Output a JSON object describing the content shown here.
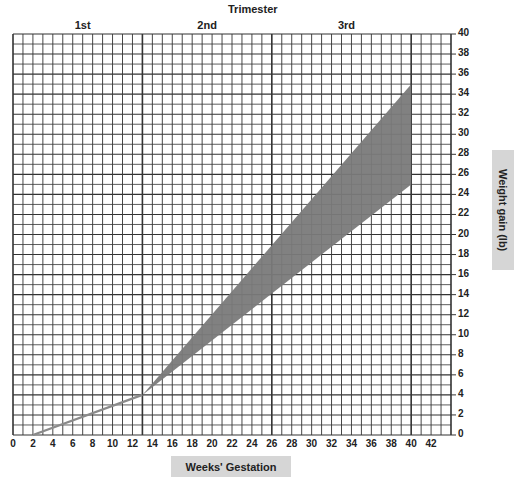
{
  "chart_data": {
    "type": "area",
    "title": "Trimester",
    "trimesters": [
      {
        "label": "1st",
        "start_week": 0,
        "end_week": 13
      },
      {
        "label": "2nd",
        "start_week": 13,
        "end_week": 26
      },
      {
        "label": "3rd",
        "start_week": 26,
        "end_week": 40
      }
    ],
    "xlabel": "Weeks' Gestation",
    "ylabel": "Weight gain (lb)",
    "xlim": [
      0,
      44
    ],
    "ylim": [
      0,
      40
    ],
    "x_ticks": [
      0,
      2,
      4,
      6,
      8,
      10,
      12,
      14,
      16,
      18,
      20,
      22,
      24,
      26,
      28,
      30,
      32,
      34,
      36,
      38,
      40,
      42
    ],
    "y_ticks": [
      0,
      2,
      4,
      6,
      8,
      10,
      12,
      14,
      16,
      18,
      20,
      22,
      24,
      26,
      28,
      30,
      32,
      34,
      36,
      38,
      40
    ],
    "grid": true,
    "grid_minor_x": 1,
    "grid_minor_y": 1,
    "series": [
      {
        "name": "First trimester gain",
        "kind": "line",
        "points": [
          [
            2,
            0
          ],
          [
            13,
            4
          ]
        ],
        "color": "#8a8a8a"
      },
      {
        "name": "Recommended weight gain range",
        "kind": "band",
        "lower": [
          [
            13,
            4
          ],
          [
            40,
            25
          ]
        ],
        "upper": [
          [
            13,
            4
          ],
          [
            40,
            35
          ]
        ],
        "color": "#7a7a7a"
      }
    ]
  },
  "labels": {
    "title": "Trimester",
    "xlabel": "Weeks' Gestation",
    "ylabel": "Weight gain (lb)"
  }
}
